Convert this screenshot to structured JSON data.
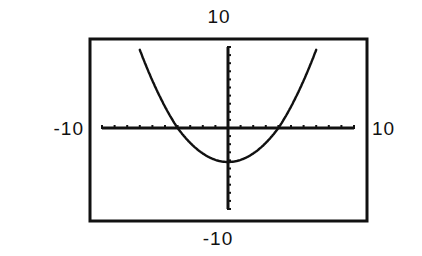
{
  "chart_data": {
    "type": "line",
    "title": "",
    "xlabel": "",
    "ylabel": "",
    "window": {
      "xmin": -10,
      "xmax": 10,
      "ymin": -10,
      "ymax": 10,
      "xscl": 1,
      "yscl": 1
    },
    "xlim": [
      -10,
      10
    ],
    "ylim": [
      -10,
      10
    ],
    "grid": false,
    "axes_visible": true,
    "tick_spacing": 1,
    "series": [
      {
        "name": "parabola",
        "equation": "y = x^2/4 - 4 (approx.)",
        "x": [
          -7,
          -6,
          -5,
          -4,
          -3,
          -2,
          -1,
          0,
          1,
          2,
          3,
          4,
          5,
          6,
          7
        ],
        "values": [
          8.25,
          5,
          2.25,
          0,
          -1.75,
          -3,
          -3.75,
          -4,
          -3.75,
          -3,
          -1.75,
          0,
          2.25,
          5,
          8.25
        ]
      }
    ],
    "annotations": {
      "roots": [
        -4,
        4
      ],
      "vertex": [
        0,
        -4
      ]
    }
  },
  "labels": {
    "ymax": "10",
    "ymin": "-10",
    "xmin": "-10",
    "xmax": "10"
  },
  "colors": {
    "ink": "#111111",
    "background": "#ffffff"
  }
}
